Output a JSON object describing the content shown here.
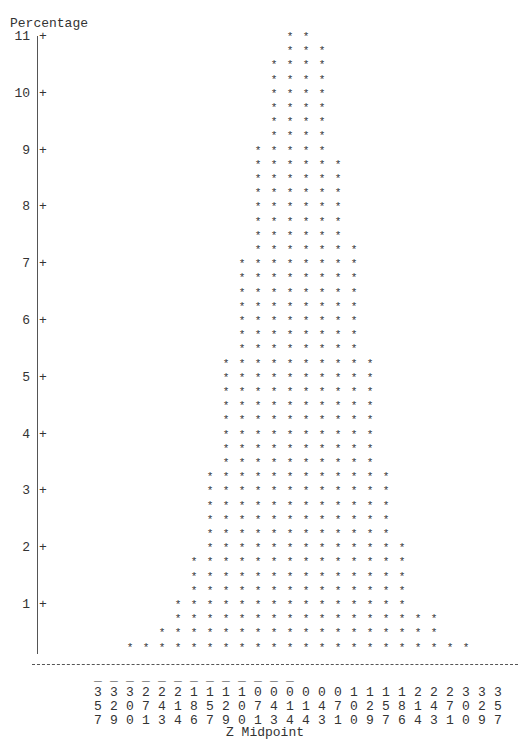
{
  "chart_data": {
    "type": "bar",
    "style": "ascii-histogram",
    "title": "",
    "xlabel": "Z Midpoint",
    "ylabel": "Percentage",
    "ylim": [
      0,
      11
    ],
    "yticks": [
      1,
      2,
      3,
      4,
      5,
      6,
      7,
      8,
      9,
      10,
      11
    ],
    "bar_symbol": "*",
    "symbol_unit": 0.25,
    "grid": false,
    "legend": null,
    "categories": [
      "-3.57",
      "-3.29",
      "-3.00",
      "-2.71",
      "-2.43",
      "-2.14",
      "-1.86",
      "-1.57",
      "-1.29",
      "-1.00",
      "-0.71",
      "-0.43",
      "-0.14",
      "0.14",
      "0.43",
      "0.71",
      "1.00",
      "1.29",
      "1.57",
      "1.86",
      "2.14",
      "2.43",
      "2.71",
      "3.00",
      "3.29",
      "3.57"
    ],
    "values": [
      0,
      0,
      0.25,
      0.25,
      0.5,
      1.0,
      1.75,
      3.25,
      5.25,
      7.0,
      9.0,
      10.5,
      11.0,
      11.0,
      10.75,
      8.75,
      7.25,
      5.25,
      3.25,
      2.0,
      0.75,
      0.75,
      0.25,
      0.25,
      0,
      0
    ]
  },
  "labels": {
    "ylabel": "Percentage",
    "xlabel": "Z Midpoint"
  }
}
